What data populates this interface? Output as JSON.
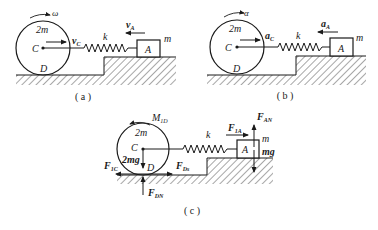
{
  "panels": [
    {
      "id": "a",
      "caption": "( a )",
      "disk_mass": "2m",
      "center_label": "C",
      "contact_label": "D",
      "rotation_label": "ω",
      "center_vector": {
        "symbol": "v",
        "sub": "C"
      },
      "spring_label": "k",
      "block_label": "A",
      "block_mass": "m",
      "block_vector": {
        "symbol": "v",
        "sub": "A"
      }
    },
    {
      "id": "b",
      "caption": "( b )",
      "disk_mass": "2m",
      "center_label": "C",
      "contact_label": "D",
      "rotation_label": "α",
      "center_vector": {
        "symbol": "a",
        "sub": "C"
      },
      "spring_label": "k",
      "block_label": "A",
      "block_mass": "m",
      "block_vector": {
        "symbol": "a",
        "sub": "A"
      }
    },
    {
      "id": "c",
      "caption": "( c )",
      "disk_mass": "2m",
      "center_label": "C",
      "contact_label": "D",
      "moment_label": {
        "symbol": "M",
        "sub": "1D"
      },
      "spring_label": "k",
      "block_label": "A",
      "block_mass": "m",
      "disk_weight": "2mg",
      "block_weight": "mg",
      "forces": {
        "inertia_disk": {
          "symbol": "F",
          "sub": "1C"
        },
        "friction_D": {
          "symbol": "F",
          "sub": "Ds"
        },
        "normal_D": {
          "symbol": "F",
          "sub": "DN"
        },
        "inertia_block": {
          "symbol": "F",
          "sub": "1A"
        },
        "normal_A": {
          "symbol": "F",
          "sub": "AN"
        }
      }
    }
  ]
}
